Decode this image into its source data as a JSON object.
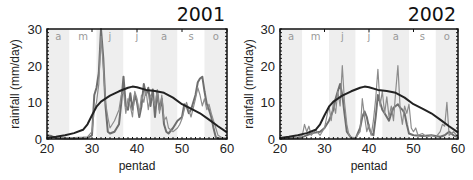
{
  "chart_data": [
    {
      "type": "line",
      "title": "2001",
      "xlabel": "pentad",
      "ylabel": "rainfall (mm/day)",
      "xlim": [
        20,
        60
      ],
      "ylim": [
        0,
        30
      ],
      "xticks": [
        20,
        30,
        40,
        50,
        60
      ],
      "yticks": [
        0,
        10,
        20,
        30
      ],
      "grid": false,
      "legend": null,
      "month_bands": [
        {
          "label": "a",
          "start": 20,
          "end": 25,
          "shaded": true
        },
        {
          "label": "m",
          "start": 25,
          "end": 31,
          "shaded": false
        },
        {
          "label": "j",
          "start": 31,
          "end": 37,
          "shaded": true
        },
        {
          "label": "j",
          "start": 37,
          "end": 43,
          "shaded": false
        },
        {
          "label": "a",
          "start": 43,
          "end": 49,
          "shaded": true
        },
        {
          "label": "s",
          "start": 49,
          "end": 55,
          "shaded": false
        },
        {
          "label": "o",
          "start": 55,
          "end": 60,
          "shaded": true
        }
      ],
      "series": [
        {
          "name": "climatology",
          "color": "#222222",
          "width": 2,
          "x": [
            20,
            22,
            24,
            26,
            28,
            29,
            30,
            31,
            32,
            34,
            36,
            38,
            39,
            40,
            42,
            44,
            46,
            48,
            50,
            52,
            54,
            56,
            58,
            60
          ],
          "y": [
            0.3,
            0.6,
            1.0,
            1.6,
            2.5,
            4.0,
            6.5,
            8.8,
            10.2,
            11.8,
            13.0,
            14.0,
            14.3,
            14.1,
            13.4,
            13.1,
            12.6,
            11.3,
            9.5,
            8.3,
            7.0,
            5.3,
            3.5,
            1.8
          ]
        },
        {
          "name": "observed-a",
          "color": "#6e6e6e",
          "width": 2,
          "x": [
            20,
            21,
            22,
            23,
            24,
            25,
            26,
            27,
            28,
            29,
            30,
            30.5,
            31,
            31.5,
            32,
            32.5,
            33,
            33.5,
            34,
            35,
            36,
            36.5,
            37,
            37.5,
            38,
            38.5,
            39,
            39.5,
            40,
            40.5,
            41,
            41.5,
            42,
            42.5,
            43,
            43.5,
            44,
            44.5,
            45,
            45.5,
            46,
            46.5,
            47,
            48,
            49,
            50,
            50.5,
            51,
            51.5,
            52,
            52.5,
            53,
            53.5,
            54,
            54.5,
            55,
            55.5,
            56,
            56.5,
            57,
            57.5,
            58,
            59,
            60
          ],
          "y": [
            1.0,
            0.8,
            0.3,
            0.2,
            0.1,
            0.1,
            0.1,
            0.2,
            0.2,
            0.3,
            1.0,
            12.0,
            14.0,
            18.0,
            30.0,
            22.0,
            9.0,
            2.0,
            1.5,
            2.0,
            4.0,
            10.0,
            17.0,
            9.0,
            8.0,
            12.5,
            8.0,
            12.0,
            10.0,
            6.0,
            9.0,
            15.0,
            12.0,
            14.0,
            9.0,
            13.5,
            6.0,
            13.0,
            8.0,
            11.0,
            4.0,
            2.0,
            1.5,
            3.0,
            5.0,
            6.0,
            9.5,
            9.0,
            7.0,
            8.0,
            10.0,
            12.0,
            15.5,
            16.5,
            17.0,
            13.0,
            9.5,
            8.0,
            6.0,
            3.0,
            0.5,
            0.2,
            0.1,
            0.1
          ]
        },
        {
          "name": "observed-b",
          "color": "#8c8c8c",
          "width": 1.2,
          "x": [
            20,
            22,
            24,
            26,
            28,
            29,
            30,
            30.5,
            31,
            31.5,
            32,
            32.5,
            33,
            33.5,
            34,
            35,
            36,
            36.5,
            37,
            37.5,
            38,
            38.5,
            39,
            39.5,
            40,
            40.5,
            41,
            41.5,
            42,
            42.5,
            43,
            43.5,
            44,
            44.5,
            45,
            45.5,
            46,
            46.5,
            47,
            48,
            49,
            49.5,
            50,
            50.5,
            51,
            51.5,
            52,
            52.5,
            53,
            53.5,
            54,
            54.5,
            55,
            55.5,
            56,
            56.5,
            57,
            57.5,
            58,
            59,
            60
          ],
          "y": [
            0.5,
            0.4,
            0.3,
            0.4,
            0.5,
            0.6,
            2.0,
            8.0,
            10.0,
            15.0,
            28.0,
            20.0,
            10.0,
            6.0,
            3.0,
            5.0,
            8.0,
            12.0,
            13.0,
            7.0,
            11.0,
            9.0,
            6.0,
            13.0,
            11.0,
            7.0,
            12.0,
            10.0,
            13.5,
            8.0,
            12.0,
            11.0,
            9.0,
            13.5,
            7.0,
            12.0,
            5.0,
            6.0,
            3.0,
            2.0,
            3.0,
            4.0,
            5.5,
            8.0,
            10.0,
            8.0,
            6.0,
            8.5,
            11.0,
            14.0,
            12.0,
            9.0,
            11.0,
            8.0,
            9.5,
            7.0,
            5.0,
            3.0,
            1.0,
            0.3,
            0.2
          ]
        }
      ]
    },
    {
      "type": "line",
      "title": "2002",
      "xlabel": "pentad",
      "ylabel": "rainfall (mm/day)",
      "xlim": [
        20,
        60
      ],
      "ylim": [
        0,
        30
      ],
      "xticks": [
        20,
        30,
        40,
        50,
        60
      ],
      "yticks": [
        0,
        10,
        20,
        30
      ],
      "grid": false,
      "legend": null,
      "month_bands": [
        {
          "label": "a",
          "start": 20,
          "end": 25,
          "shaded": true
        },
        {
          "label": "m",
          "start": 25,
          "end": 31,
          "shaded": false
        },
        {
          "label": "j",
          "start": 31,
          "end": 37,
          "shaded": true
        },
        {
          "label": "j",
          "start": 37,
          "end": 43,
          "shaded": false
        },
        {
          "label": "a",
          "start": 43,
          "end": 49,
          "shaded": true
        },
        {
          "label": "s",
          "start": 49,
          "end": 55,
          "shaded": false
        },
        {
          "label": "o",
          "start": 55,
          "end": 60,
          "shaded": true
        }
      ],
      "series": [
        {
          "name": "climatology",
          "color": "#222222",
          "width": 2,
          "x": [
            20,
            22,
            24,
            26,
            28,
            29,
            30,
            31,
            32,
            34,
            36,
            38,
            39,
            40,
            42,
            44,
            46,
            48,
            50,
            52,
            54,
            56,
            58,
            60
          ],
          "y": [
            0.3,
            0.6,
            1.0,
            1.6,
            2.5,
            4.0,
            6.5,
            8.8,
            10.2,
            11.8,
            13.0,
            14.0,
            14.3,
            14.1,
            13.4,
            13.1,
            12.6,
            11.3,
            9.5,
            8.3,
            7.0,
            5.3,
            3.5,
            1.8
          ]
        },
        {
          "name": "observed-a",
          "color": "#6e6e6e",
          "width": 2,
          "x": [
            20,
            22,
            24,
            25,
            26,
            27,
            28,
            29,
            30,
            31,
            32,
            32.5,
            33,
            33.5,
            34,
            34.5,
            35,
            36,
            37,
            38,
            38.5,
            39,
            39.5,
            40,
            40.5,
            41,
            41.5,
            42,
            42.5,
            43,
            43.5,
            44,
            44.5,
            45,
            45.5,
            46,
            46.5,
            47,
            47.5,
            48,
            48.5,
            49,
            50,
            52,
            54,
            56,
            57,
            58,
            59,
            60
          ],
          "y": [
            0.1,
            0.2,
            0.3,
            0.5,
            1.0,
            1.5,
            1.8,
            2.0,
            3.0,
            5.0,
            8.0,
            11.0,
            13.0,
            15.0,
            12.0,
            7.0,
            2.0,
            0.3,
            0.2,
            3.0,
            6.0,
            7.5,
            6.0,
            3.0,
            1.5,
            1.0,
            6.0,
            12.0,
            10.0,
            8.0,
            7.0,
            6.0,
            5.0,
            7.0,
            8.5,
            9.0,
            9.5,
            8.5,
            8.0,
            7.0,
            4.0,
            1.5,
            1.0,
            0.8,
            1.0,
            0.6,
            1.0,
            2.0,
            1.0,
            0.5
          ]
        },
        {
          "name": "observed-b",
          "color": "#8c8c8c",
          "width": 1.2,
          "x": [
            20,
            22,
            24,
            25,
            25.5,
            26,
            26.5,
            27,
            28,
            29,
            30,
            30.5,
            31,
            31.5,
            32,
            32.5,
            33,
            33.5,
            34,
            34.5,
            35,
            35.5,
            36,
            37,
            38,
            38.5,
            39,
            39.5,
            40,
            40.5,
            41,
            41.5,
            42,
            42.5,
            43,
            43.5,
            44,
            44.5,
            45,
            45.5,
            46,
            46.5,
            47,
            47.5,
            48,
            48.5,
            49,
            49.5,
            50,
            50.5,
            51,
            52,
            53,
            54,
            55,
            56,
            56.5,
            57,
            57.5,
            58,
            59,
            60
          ],
          "y": [
            0.2,
            0.3,
            0.4,
            1.0,
            4.0,
            2.0,
            3.5,
            1.0,
            2.5,
            1.0,
            3.0,
            6.0,
            9.0,
            5.0,
            10.0,
            7.0,
            13.0,
            9.0,
            20.0,
            10.0,
            4.0,
            1.0,
            0.5,
            0.3,
            2.0,
            11.0,
            6.0,
            2.0,
            4.0,
            1.0,
            5.0,
            11.0,
            19.0,
            9.0,
            13.0,
            7.0,
            11.5,
            6.0,
            9.0,
            5.0,
            13.0,
            20.0,
            8.0,
            4.0,
            9.0,
            7.0,
            9.5,
            3.0,
            2.0,
            3.0,
            1.0,
            1.5,
            0.5,
            1.0,
            0.5,
            2.0,
            4.0,
            3.5,
            10.0,
            1.0,
            2.0,
            0.5
          ]
        }
      ]
    }
  ],
  "panels": [
    {
      "title": "2001",
      "xlabel": "pentad",
      "ylabel": "rainfall (mm/day)",
      "xtick_labels": [
        "20",
        "30",
        "40",
        "50",
        "60"
      ],
      "ytick_labels": [
        "0",
        "10",
        "20",
        "30"
      ],
      "month_labels": [
        "a",
        "m",
        "j",
        "j",
        "a",
        "s",
        "o"
      ]
    },
    {
      "title": "2002",
      "xlabel": "pentad",
      "ylabel": "rainfall (mm/day)",
      "xtick_labels": [
        "20",
        "30",
        "40",
        "50",
        "60"
      ],
      "ytick_labels": [
        "0",
        "10",
        "20",
        "30"
      ],
      "month_labels": [
        "a",
        "m",
        "j",
        "j",
        "a",
        "s",
        "o"
      ]
    }
  ],
  "colors": {
    "band_shaded": "#eeeeee",
    "band_clear": "#ffffff",
    "frame": "#111111",
    "month_label": "#999999"
  }
}
